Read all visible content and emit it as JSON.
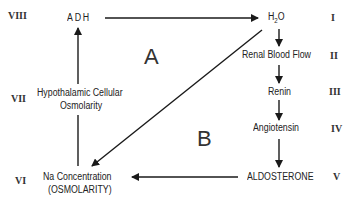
{
  "diagram": {
    "nodes": {
      "adh": "ADH",
      "h2o_main": "H",
      "h2o_sub": "2",
      "h2o_tail": "O",
      "renal_blood_flow": "Renal Blood Flow",
      "renin": "Renin",
      "angiotensin": "Angiotensin",
      "aldosterone": "ALDOSTERONE",
      "na_concentration_line1": "Na Concentration",
      "na_concentration_line2": "(OSMOLARITY)",
      "hypothalamic_line1": "Hypothalamic Cellular",
      "hypothalamic_line2": "Osmolarity"
    },
    "roman_numerals": {
      "I": "I",
      "II": "II",
      "III": "III",
      "IV": "IV",
      "V": "V",
      "VI": "VI",
      "VII": "VII",
      "VIII": "VIII"
    },
    "regions": {
      "A": "A",
      "B": "B"
    },
    "colors": {
      "line": "#1a1a1a",
      "text": "#222222",
      "background": "#ffffff"
    }
  }
}
